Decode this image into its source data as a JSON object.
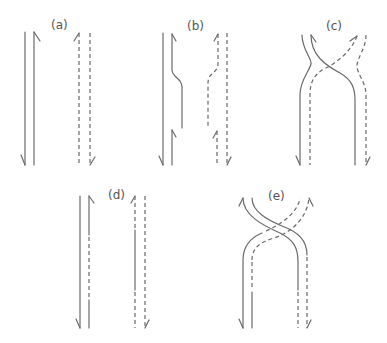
{
  "figure": {
    "panels": [
      {
        "id": "a",
        "label": "(a)",
        "description": "Two separate antiparallel duplexes, solid and dashed"
      },
      {
        "id": "b",
        "label": "(b)",
        "description": "Duplexes with staggered nicks on inner strands"
      },
      {
        "id": "c",
        "label": "(c)",
        "description": "Inner strands exchanged, crossing over"
      },
      {
        "id": "d",
        "label": "(d)",
        "description": "Resolved duplexes with hybrid inner strands"
      },
      {
        "id": "e",
        "label": "(e)",
        "description": "Crossed strand exchange structure"
      }
    ],
    "line_color": "#6a6a6a",
    "background": "#ffffff"
  }
}
